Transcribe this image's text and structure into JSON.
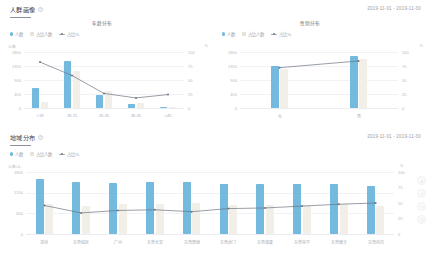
{
  "sections": [
    {
      "id": "user-profile",
      "title": "人群画像",
      "help_icon": "help-icon",
      "date_range": "2019-11-01 - 2019-11-30",
      "legend": [
        {
          "icon": "dot",
          "label": "人数",
          "color": "#74b9de"
        },
        {
          "icon": "bar",
          "label": "占比人数",
          "color": "#f1efe8"
        },
        {
          "icon": "line",
          "label": "占比%",
          "color": "#6d7480"
        }
      ]
    },
    {
      "id": "region-distribution",
      "title": "地域分布",
      "help_icon": "help-icon",
      "date_range": "2019-11-01 - 2019-11-30",
      "legend": [
        {
          "icon": "dot",
          "label": "人数",
          "color": "#74b9de"
        },
        {
          "icon": "bar",
          "label": "占比人数",
          "color": "#f1efe8"
        },
        {
          "icon": "line",
          "label": "占比%",
          "color": "#6d7480"
        }
      ]
    }
  ],
  "rail": [
    {
      "name": "scroll-top-icon",
      "glyph": "▲"
    },
    {
      "name": "share-icon",
      "glyph": "❖"
    },
    {
      "name": "comment-icon",
      "glyph": "▭"
    },
    {
      "name": "help-circle-icon",
      "glyph": "?"
    }
  ],
  "chart_data": [
    {
      "type": "bar",
      "id": "age-distribution",
      "title": "年龄分布",
      "categories": [
        "<18",
        "18-25",
        "26-35",
        "36-45",
        ">45"
      ],
      "series": [
        {
          "name": "人数",
          "type": "bar",
          "color": "#74b9de",
          "values": [
            640,
            1520,
            430,
            120,
            30
          ]
        },
        {
          "name": "占比人数",
          "type": "bar",
          "color": "#f1efe8",
          "values": [
            180,
            1180,
            560,
            150,
            40
          ]
        },
        {
          "name": "占比%",
          "type": "line",
          "color": "#6d7480",
          "values": [
            82,
            58,
            26,
            18,
            24
          ]
        }
      ],
      "xlabel": "",
      "ylabel": "人数",
      "y2label": "%",
      "ylim": [
        0,
        1800
      ],
      "y_ticks": [
        "1800",
        "1350",
        "900",
        "450",
        "0"
      ],
      "y2lim": [
        0,
        100
      ],
      "y2_ticks": [
        "100",
        "75",
        "50",
        "25",
        "0"
      ],
      "grid": true,
      "legend_position": "top-left"
    },
    {
      "type": "bar",
      "id": "gender-distribution",
      "title": "性别分布",
      "categories": [
        "女",
        "男"
      ],
      "series": [
        {
          "name": "人数",
          "type": "bar",
          "color": "#74b9de",
          "values": [
            1360,
            1660
          ]
        },
        {
          "name": "占比人数",
          "type": "bar",
          "color": "#f1efe8",
          "values": [
            1240,
            1580
          ]
        },
        {
          "name": "占比%",
          "type": "line",
          "color": "#6d7480",
          "values": [
            72,
            84
          ]
        }
      ],
      "xlabel": "",
      "ylabel": "人数",
      "y2label": "%",
      "ylim": [
        0,
        1800
      ],
      "y_ticks": [
        "1800",
        "1350",
        "900",
        "450",
        "0"
      ],
      "y2lim": [
        0,
        100
      ],
      "y2_ticks": [
        "100",
        "75",
        "50",
        "25",
        "0"
      ],
      "grid": true,
      "legend_position": "top-left"
    },
    {
      "type": "bar",
      "id": "region-bars",
      "title": "",
      "categories": [
        "深圳",
        "东莞城区",
        "广州",
        "东莞长安",
        "东莞厚街",
        "东莞虎门",
        "东莞塘厦",
        "东莞常平",
        "东莞寮步",
        "东莞凤岗"
      ],
      "series": [
        {
          "name": "人数",
          "type": "bar",
          "color": "#74b9de",
          "values": [
            1600,
            1520,
            1480,
            1500,
            1520,
            1440,
            1460,
            1460,
            1450,
            1400
          ]
        },
        {
          "name": "占比人数",
          "type": "bar",
          "color": "#f1efe8",
          "values": [
            880,
            820,
            880,
            880,
            900,
            840,
            840,
            840,
            860,
            820
          ]
        },
        {
          "name": "占比%",
          "type": "line",
          "color": "#6d7480",
          "values": [
            46,
            34,
            38,
            39,
            36,
            41,
            42,
            45,
            48,
            50
          ]
        }
      ],
      "xlabel": "",
      "ylabel": "人数/人",
      "y2label": "%",
      "ylim": [
        0,
        1800
      ],
      "y_ticks": [
        "1800",
        "1200",
        "600",
        "0"
      ],
      "y2lim": [
        0,
        100
      ],
      "y2_ticks": [
        "100",
        "75",
        "50",
        "25",
        "0"
      ],
      "grid": true,
      "legend_position": "top-left"
    }
  ]
}
